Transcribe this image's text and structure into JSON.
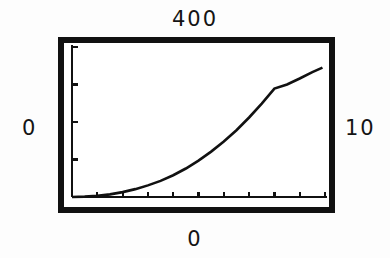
{
  "figure": {
    "background_color": "#fdfdfd",
    "frame_color": "#111111",
    "curve_color": "#111111",
    "labels": {
      "top": "400",
      "left": "0",
      "right": "10",
      "bottom": "0"
    }
  },
  "chart_data": {
    "type": "line",
    "title": "",
    "subtitle": "",
    "xlabel": "",
    "ylabel": "",
    "corner_labels": {
      "top": "400",
      "left": "0",
      "right": "10",
      "bottom": "0"
    },
    "xlim": [
      0,
      10
    ],
    "ylim": [
      0,
      400
    ],
    "x_tick_labels": [
      "0",
      "10"
    ],
    "y_tick_labels": [
      "0",
      "400"
    ],
    "x_tick_count": 10,
    "y_tick_count": 4,
    "grid": false,
    "legend": null,
    "legend_position": "none",
    "annotations": [],
    "series": [
      {
        "name": "curve",
        "x": [
          0.0,
          0.5,
          1.0,
          1.5,
          2.0,
          2.5,
          3.0,
          3.5,
          4.0,
          4.5,
          5.0,
          5.5,
          6.0,
          6.5,
          7.0,
          7.5,
          8.0,
          8.5,
          9.0,
          9.5,
          9.9
        ],
        "y": [
          0,
          1,
          3,
          7,
          13,
          21,
          31,
          43,
          58,
          76,
          97,
          121,
          148,
          178,
          212,
          249,
          289,
          300,
          316,
          333,
          345
        ]
      }
    ]
  }
}
